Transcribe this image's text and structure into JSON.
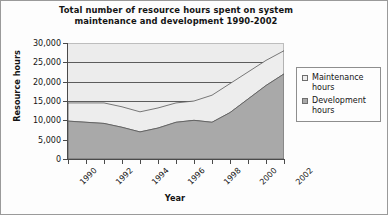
{
  "chart_data": {
    "type": "area",
    "stacked": true,
    "title": "Total number of resource hours spent on system maintenance and development 1990-2002",
    "title_lines": [
      "Total number of resource hours spent on system",
      "maintenance and development 1990-2002"
    ],
    "xlabel": "Year",
    "ylabel": "Resource hours",
    "x": [
      1990,
      1991,
      1992,
      1993,
      1994,
      1995,
      1996,
      1997,
      1998,
      1999,
      2000,
      2001,
      2002
    ],
    "xticklabels": [
      "1990",
      "1992",
      "1994",
      "1996",
      "1998",
      "2000",
      "2002"
    ],
    "xtick_values": [
      1990,
      1992,
      1994,
      1996,
      1998,
      2000,
      2002
    ],
    "yticklabels": [
      "0",
      "5,000",
      "10,000",
      "15,000",
      "20,000",
      "25,000",
      "30,000"
    ],
    "ytick_values": [
      0,
      5000,
      10000,
      15000,
      20000,
      25000,
      30000
    ],
    "ylim": [
      0,
      30000
    ],
    "xlim": [
      1990,
      2002
    ],
    "grid": true,
    "legend_position": "right",
    "series": [
      {
        "name": "Development hours",
        "color": "#a9a9a9",
        "values": [
          9800,
          9500,
          9200,
          8200,
          7000,
          8000,
          9500,
          10000,
          9500,
          12000,
          15500,
          19000,
          22000
        ]
      },
      {
        "name": "Maintenance hours",
        "color": "#ededed",
        "values": [
          4700,
          5000,
          5300,
          5300,
          5200,
          5200,
          5000,
          5000,
          7000,
          7500,
          7000,
          6500,
          6000
        ]
      }
    ],
    "totals": [
      14500,
      14500,
      14500,
      13500,
      12200,
      13200,
      14500,
      15000,
      16500,
      19500,
      22500,
      25500,
      28000
    ]
  },
  "legend": {
    "items": [
      {
        "label_line1": "Maintenance",
        "label_line2": "hours",
        "swatch": "#ededed"
      },
      {
        "label_line1": "Development",
        "label_line2": "hours",
        "swatch": "#a9a9a9"
      }
    ]
  }
}
